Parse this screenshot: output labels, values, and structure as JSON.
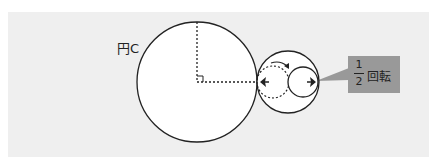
{
  "diagram": {
    "circle_label": "円C",
    "callout": {
      "numerator": "1",
      "denominator": "2",
      "text": "回転"
    },
    "colors": {
      "panel_bg": "#efefef",
      "callout_bg": "#999999",
      "stroke": "#222222",
      "fill": "#ffffff"
    }
  }
}
